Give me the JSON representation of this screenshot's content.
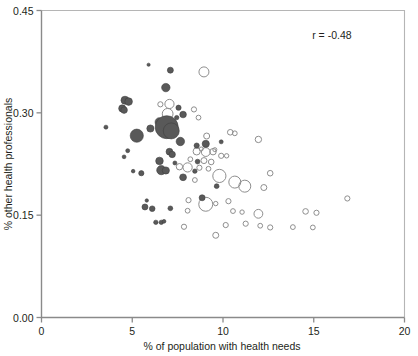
{
  "chart_data": {
    "type": "scatter",
    "title": "",
    "xlabel": "% of population with health needs",
    "ylabel": "% other health professionals",
    "xlim": [
      0,
      20
    ],
    "ylim": [
      0.0,
      0.45
    ],
    "xticks": [
      0,
      5,
      10,
      15,
      20
    ],
    "xticklabels": [
      "0",
      "5",
      "10",
      "15",
      "20"
    ],
    "yticks": [
      0.0,
      0.15,
      0.3,
      0.45
    ],
    "yticklabels": [
      "0.00",
      "0.15",
      "0.30",
      "0.45"
    ],
    "grid": false,
    "legend": null,
    "annotations": [
      {
        "text": "r = -0.48",
        "x": 16.0,
        "y": 0.408
      }
    ],
    "marker_encoding": {
      "size_meaning": "bubble area varies by point weight",
      "filled_color": "#595959",
      "open_color": "#8e8e8e"
    },
    "series": [
      {
        "name": "filled",
        "style": "filled",
        "points": [
          {
            "x": 5.9,
            "y": 0.3705,
            "r": 1.6
          },
          {
            "x": 7.1,
            "y": 0.3625,
            "r": 3.0
          },
          {
            "x": 6.85,
            "y": 0.337,
            "r": 4.2
          },
          {
            "x": 4.6,
            "y": 0.3185,
            "r": 4.0
          },
          {
            "x": 4.8,
            "y": 0.3165,
            "r": 3.8
          },
          {
            "x": 4.45,
            "y": 0.3065,
            "r": 3.6
          },
          {
            "x": 4.55,
            "y": 0.304,
            "r": 3.3
          },
          {
            "x": 7.55,
            "y": 0.3075,
            "r": 2.6
          },
          {
            "x": 7.8,
            "y": 0.2975,
            "r": 3.3
          },
          {
            "x": 7.45,
            "y": 0.293,
            "r": 2.2
          },
          {
            "x": 6.5,
            "y": 0.2865,
            "r": 4.4
          },
          {
            "x": 6.9,
            "y": 0.279,
            "r": 11.5
          },
          {
            "x": 7.15,
            "y": 0.2735,
            "r": 8.0
          },
          {
            "x": 6.0,
            "y": 0.277,
            "r": 3.6
          },
          {
            "x": 3.55,
            "y": 0.279,
            "r": 2.0
          },
          {
            "x": 5.25,
            "y": 0.2665,
            "r": 6.6
          },
          {
            "x": 7.65,
            "y": 0.258,
            "r": 4.2
          },
          {
            "x": 8.55,
            "y": 0.252,
            "r": 2.6
          },
          {
            "x": 9.05,
            "y": 0.2545,
            "r": 3.6
          },
          {
            "x": 9.9,
            "y": 0.2575,
            "r": 2.0
          },
          {
            "x": 4.75,
            "y": 0.2445,
            "r": 2.0
          },
          {
            "x": 7.05,
            "y": 0.243,
            "r": 3.4
          },
          {
            "x": 7.2,
            "y": 0.239,
            "r": 3.2
          },
          {
            "x": 4.55,
            "y": 0.2355,
            "r": 1.9
          },
          {
            "x": 6.5,
            "y": 0.2295,
            "r": 3.8
          },
          {
            "x": 7.35,
            "y": 0.2265,
            "r": 2.0
          },
          {
            "x": 6.6,
            "y": 0.216,
            "r": 4.6
          },
          {
            "x": 6.85,
            "y": 0.2155,
            "r": 3.6
          },
          {
            "x": 5.05,
            "y": 0.2145,
            "r": 1.8
          },
          {
            "x": 5.5,
            "y": 0.2115,
            "r": 2.6
          },
          {
            "x": 7.8,
            "y": 0.2055,
            "r": 3.4
          },
          {
            "x": 9.65,
            "y": 0.1925,
            "r": 2.4
          },
          {
            "x": 8.85,
            "y": 0.1755,
            "r": 3.0
          },
          {
            "x": 5.8,
            "y": 0.1715,
            "r": 1.7
          },
          {
            "x": 5.7,
            "y": 0.162,
            "r": 3.0
          },
          {
            "x": 6.1,
            "y": 0.1595,
            "r": 2.8
          },
          {
            "x": 7.1,
            "y": 0.16,
            "r": 2.4
          },
          {
            "x": 6.3,
            "y": 0.1395,
            "r": 2.2
          },
          {
            "x": 6.6,
            "y": 0.1395,
            "r": 2.2
          },
          {
            "x": 6.75,
            "y": 0.141,
            "r": 1.9
          },
          {
            "x": 8.6,
            "y": 0.2285,
            "r": 2.4
          },
          {
            "x": 8.45,
            "y": 0.2145,
            "r": 2.2
          }
        ]
      },
      {
        "name": "open",
        "style": "open",
        "points": [
          {
            "x": 8.95,
            "y": 0.36,
            "r": 5.0
          },
          {
            "x": 6.55,
            "y": 0.3125,
            "r": 2.6
          },
          {
            "x": 7.05,
            "y": 0.313,
            "r": 4.6
          },
          {
            "x": 8.4,
            "y": 0.305,
            "r": 2.6
          },
          {
            "x": 6.95,
            "y": 0.2985,
            "r": 5.4
          },
          {
            "x": 8.65,
            "y": 0.293,
            "r": 2.4
          },
          {
            "x": 9.1,
            "y": 0.266,
            "r": 3.0
          },
          {
            "x": 10.4,
            "y": 0.2715,
            "r": 2.8
          },
          {
            "x": 10.65,
            "y": 0.27,
            "r": 2.4
          },
          {
            "x": 11.95,
            "y": 0.261,
            "r": 3.2
          },
          {
            "x": 8.55,
            "y": 0.2435,
            "r": 3.6
          },
          {
            "x": 9.05,
            "y": 0.2425,
            "r": 4.4
          },
          {
            "x": 9.45,
            "y": 0.243,
            "r": 3.2
          },
          {
            "x": 9.9,
            "y": 0.237,
            "r": 2.6
          },
          {
            "x": 10.2,
            "y": 0.237,
            "r": 2.2
          },
          {
            "x": 8.2,
            "y": 0.232,
            "r": 2.4
          },
          {
            "x": 8.95,
            "y": 0.23,
            "r": 3.0
          },
          {
            "x": 9.35,
            "y": 0.228,
            "r": 2.8
          },
          {
            "x": 7.6,
            "y": 0.221,
            "r": 3.2
          },
          {
            "x": 8.05,
            "y": 0.22,
            "r": 4.6
          },
          {
            "x": 8.7,
            "y": 0.2195,
            "r": 2.6
          },
          {
            "x": 9.2,
            "y": 0.218,
            "r": 2.4
          },
          {
            "x": 9.8,
            "y": 0.2075,
            "r": 6.6
          },
          {
            "x": 12.6,
            "y": 0.2115,
            "r": 2.8
          },
          {
            "x": 8.45,
            "y": 0.2015,
            "r": 2.4
          },
          {
            "x": 10.65,
            "y": 0.1985,
            "r": 6.0
          },
          {
            "x": 11.2,
            "y": 0.1925,
            "r": 6.0
          },
          {
            "x": 12.25,
            "y": 0.1905,
            "r": 3.0
          },
          {
            "x": 8.1,
            "y": 0.172,
            "r": 2.6
          },
          {
            "x": 9.05,
            "y": 0.166,
            "r": 7.0
          },
          {
            "x": 9.6,
            "y": 0.167,
            "r": 2.2
          },
          {
            "x": 10.3,
            "y": 0.1705,
            "r": 2.6
          },
          {
            "x": 16.85,
            "y": 0.1745,
            "r": 2.6
          },
          {
            "x": 8.05,
            "y": 0.1565,
            "r": 2.4
          },
          {
            "x": 10.55,
            "y": 0.156,
            "r": 2.4
          },
          {
            "x": 11.05,
            "y": 0.1545,
            "r": 2.2
          },
          {
            "x": 11.95,
            "y": 0.152,
            "r": 4.4
          },
          {
            "x": 14.55,
            "y": 0.1555,
            "r": 2.8
          },
          {
            "x": 15.15,
            "y": 0.1535,
            "r": 2.6
          },
          {
            "x": 7.85,
            "y": 0.133,
            "r": 2.6
          },
          {
            "x": 10.15,
            "y": 0.1355,
            "r": 2.6
          },
          {
            "x": 11.25,
            "y": 0.1375,
            "r": 2.6
          },
          {
            "x": 12.05,
            "y": 0.1345,
            "r": 2.4
          },
          {
            "x": 12.6,
            "y": 0.132,
            "r": 2.6
          },
          {
            "x": 13.85,
            "y": 0.1325,
            "r": 2.4
          },
          {
            "x": 14.95,
            "y": 0.132,
            "r": 2.4
          },
          {
            "x": 9.6,
            "y": 0.1205,
            "r": 3.0
          },
          {
            "x": 8.8,
            "y": 0.247,
            "r": 2.0
          },
          {
            "x": 9.55,
            "y": 0.246,
            "r": 2.0
          }
        ]
      }
    ]
  }
}
